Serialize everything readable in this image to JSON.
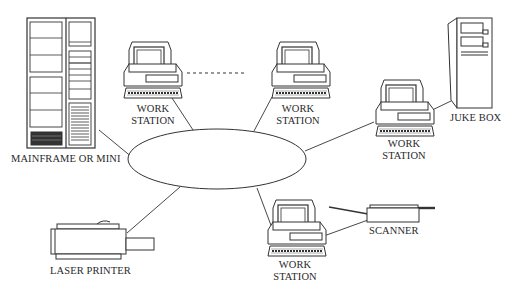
{
  "diagram": {
    "type": "network-topology",
    "hub": {
      "shape": "ellipse",
      "label": ""
    },
    "nodes": [
      {
        "id": "mainframe",
        "label": "MAINFRAME OR MINI",
        "icon": "mainframe-icon"
      },
      {
        "id": "ws1",
        "label_line1": "WORK",
        "label_line2": "STATION",
        "icon": "workstation-icon"
      },
      {
        "id": "ws2",
        "label_line1": "WORK",
        "label_line2": "STATION",
        "icon": "workstation-icon"
      },
      {
        "id": "ws3",
        "label_line1": "WORK",
        "label_line2": "STATION",
        "icon": "workstation-icon"
      },
      {
        "id": "ws4",
        "label_line1": "WORK",
        "label_line2": "STATION",
        "icon": "workstation-icon"
      },
      {
        "id": "jukebox",
        "label": "JUKE BOX",
        "icon": "jukebox-icon"
      },
      {
        "id": "printer",
        "label": "LASER PRINTER",
        "icon": "laser-printer-icon"
      },
      {
        "id": "scanner",
        "label": "SCANNER",
        "icon": "scanner-icon"
      }
    ],
    "edges": [
      [
        "mainframe",
        "hub"
      ],
      [
        "ws1",
        "hub"
      ],
      [
        "ws2",
        "hub"
      ],
      [
        "ws3",
        "hub"
      ],
      [
        "printer",
        "hub"
      ],
      [
        "ws4",
        "hub"
      ],
      [
        "ws3",
        "jukebox"
      ],
      [
        "ws4",
        "scanner"
      ]
    ],
    "ellipsis_between": [
      "ws1",
      "ws2"
    ]
  }
}
